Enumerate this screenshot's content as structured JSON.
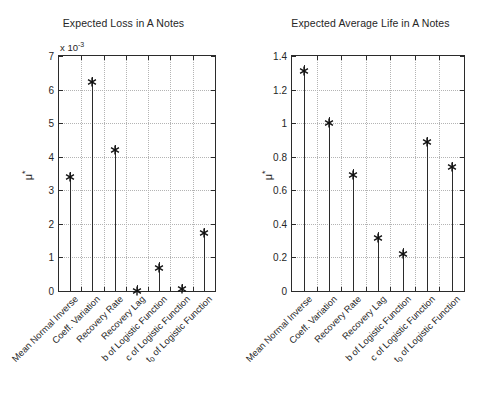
{
  "figure": {
    "background": "#ffffff",
    "foreground": "#2b2b2b",
    "grid_color": "#b4b4b4"
  },
  "categories": [
    "Mean Normal Inverse",
    "Coeff. Variation",
    "Recovery Rate",
    "Recovery Lag",
    "b of Logistic Function",
    "c of Logistic Function",
    "t₀ of Logistic Function"
  ],
  "panels": {
    "left": {
      "title": "Expected Loss in A Notes",
      "ylabel": "μ",
      "ylabel_superscript": "*",
      "exponent_note": "x 10",
      "exponent_value": "-3",
      "yticks": [
        "0",
        "1",
        "2",
        "3",
        "4",
        "5",
        "6",
        "7"
      ]
    },
    "right": {
      "title": "Expected Average Life in A Notes",
      "ylabel": "μ",
      "ylabel_superscript": "*",
      "yticks": [
        "0",
        "0.2",
        "0.4",
        "0.6",
        "0.8",
        "1",
        "1.2",
        "1.4"
      ]
    }
  },
  "chart_data": [
    {
      "type": "bar",
      "plot_style": "stem",
      "title": "Expected Loss in A Notes",
      "xlabel": "",
      "ylabel": "μ*",
      "y_scale_factor": "x 10^-3",
      "ylim": [
        0,
        7
      ],
      "yticks": [
        0,
        1,
        2,
        3,
        4,
        5,
        6,
        7
      ],
      "grid": true,
      "legend": "none",
      "marker": "asterisk",
      "categories": [
        "Mean Normal Inverse",
        "Coeff. Variation",
        "Recovery Rate",
        "Recovery Lag",
        "b of Logistic Function",
        "c of Logistic Function",
        "t₀ of Logistic Function"
      ],
      "values": [
        3.55,
        6.38,
        4.35,
        0.17,
        0.85,
        0.21,
        1.89
      ]
    },
    {
      "type": "bar",
      "plot_style": "stem",
      "title": "Expected Average Life in A Notes",
      "xlabel": "",
      "ylabel": "μ*",
      "ylim": [
        0,
        1.4
      ],
      "yticks": [
        0,
        0.2,
        0.4,
        0.6,
        0.8,
        1.0,
        1.2,
        1.4
      ],
      "grid": true,
      "legend": "none",
      "marker": "asterisk",
      "categories": [
        "Mean Normal Inverse",
        "Coeff. Variation",
        "Recovery Rate",
        "Recovery Lag",
        "b of Logistic Function",
        "c of Logistic Function",
        "t₀ of Logistic Function"
      ],
      "values": [
        1.345,
        1.035,
        0.725,
        0.35,
        0.255,
        0.92,
        0.77
      ]
    }
  ]
}
